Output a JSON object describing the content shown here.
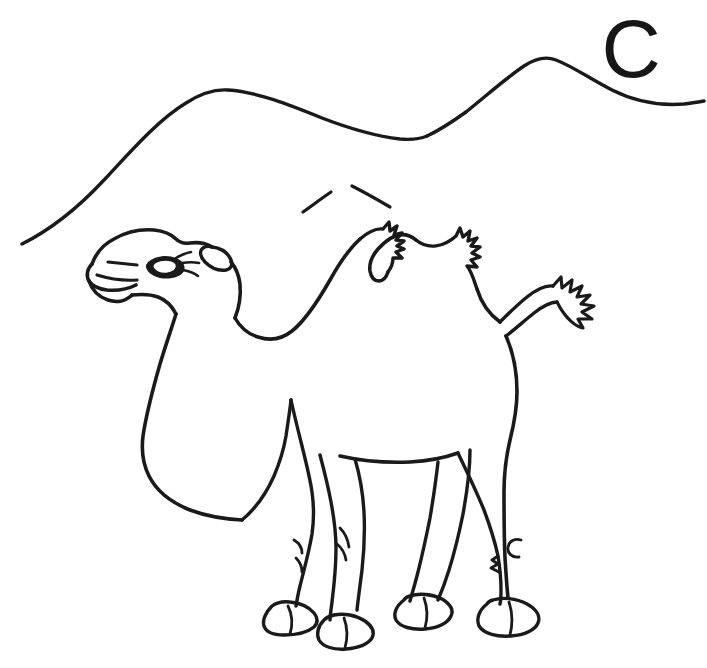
{
  "page": {
    "width": 707,
    "height": 668,
    "background_color": "#ffffff",
    "ink_color": "#1a1a1a",
    "style": "black and white line art / coloring book outline"
  },
  "letter": {
    "character": "C",
    "position": "top-right",
    "color": "#161616"
  },
  "scene": {
    "subject_name": "camel",
    "subject_type": "Bactrian camel (two humps)",
    "orientation": "facing left, standing in profile",
    "background_name": "sand dunes",
    "background_elements": [
      "large foreground dune ridge rising from lower-left to a rounded crest",
      "second smaller dune peak behind and to the right",
      "short broken slope stroke on the near dune face"
    ],
    "parts": [
      "head",
      "muzzle",
      "mouth",
      "nostril",
      "eye",
      "eyelashes",
      "ear",
      "neck",
      "front hump",
      "rear hump",
      "body",
      "belly",
      "rump",
      "tail",
      "tail tuft",
      "front legs",
      "hind legs",
      "knees",
      "hocks",
      "split hooves"
    ],
    "hump_count": 2,
    "leg_count": 4,
    "hoof_count": 4,
    "texture_notes": "jagged fur tufts drawn along the top of both humps and at the tip of the tail"
  }
}
